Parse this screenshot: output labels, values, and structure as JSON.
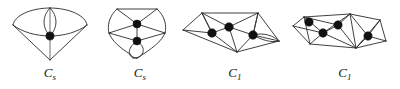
{
  "figure": {
    "kind": "diagram",
    "background_color": "#ffffff",
    "stroke_color": "#2b2b2b",
    "node_fill_color": "#111111",
    "panel_count": 4,
    "panels": [
      {
        "index": 1,
        "name": "graph-1",
        "label_base": "C",
        "label_sub": "s",
        "label_text": "Cs",
        "marked_vertex_count": 1,
        "shape_note": "kite / cone outline with vertical lens (bigon) above a single marked interior vertex"
      },
      {
        "index": 2,
        "name": "graph-2",
        "label_base": "C",
        "label_sub": "s",
        "label_text": "Cs",
        "marked_vertex_count": 2,
        "shape_note": "pentagon-like outline, two marked vertices on the vertical axis, lens (bigon) at the bottom"
      },
      {
        "index": 3,
        "name": "graph-3",
        "label_base": "C",
        "label_sub": "1",
        "label_text": "C1",
        "marked_vertex_count": 3,
        "shape_note": "triangulated wide polygon, three marked interior vertices, small lens on the right edge"
      },
      {
        "index": 4,
        "name": "graph-4",
        "label_base": "C",
        "label_sub": "1",
        "label_text": "C1",
        "marked_vertex_count": 4,
        "shape_note": "triangulated elongated strip, four marked interior vertices in zig-zag, sliver triangle on the left"
      }
    ]
  }
}
